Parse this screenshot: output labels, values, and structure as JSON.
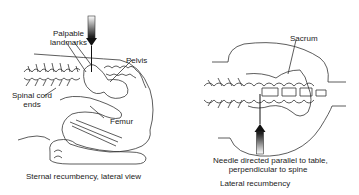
{
  "left_panel": {
    "labels": {
      "palpable_landmarks": [
        "Palpable",
        "landmarks"
      ],
      "pelvis": "Pelvis",
      "spinal_cord_ends": [
        "Spinal cord",
        "ends"
      ],
      "femur": "Femur"
    },
    "caption": "Sternal recumbency, lateral view"
  },
  "right_panel": {
    "labels": {
      "sacrum": "Sacrum",
      "needle_direction": [
        "Needle directed parallel to table,",
        "perpendicular to spine"
      ]
    },
    "caption": "Lateral recumbency"
  },
  "colors": {
    "line": "#333333",
    "needle_dark": "#111111",
    "text": "#222222"
  }
}
